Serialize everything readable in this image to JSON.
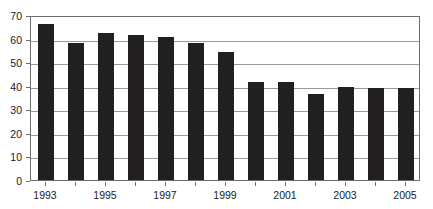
{
  "chart_data": {
    "type": "bar",
    "title": "",
    "subtitle": "",
    "xlabel": "",
    "ylabel": "",
    "categories": [
      "1993",
      "1994",
      "1995",
      "1996",
      "1997",
      "1998",
      "1999",
      "2000",
      "2001",
      "2002",
      "2003",
      "2004",
      "2005"
    ],
    "values": [
      66,
      58,
      62.5,
      61.5,
      60.5,
      58,
      54.5,
      41.5,
      41.5,
      36.5,
      39.5,
      39,
      39
    ],
    "series": [
      {
        "name": "",
        "values": [
          66,
          58,
          62.5,
          61.5,
          60.5,
          58,
          54.5,
          41.5,
          41.5,
          36.5,
          39.5,
          39,
          39
        ]
      }
    ],
    "ylim": [
      0,
      70
    ],
    "ytick_labels": [
      "0",
      "10",
      "20",
      "30",
      "40",
      "50",
      "60",
      "70"
    ],
    "ytick_values": [
      0,
      10,
      20,
      30,
      40,
      50,
      60,
      70
    ],
    "xtick_labels": [
      "1993",
      "1995",
      "1997",
      "1999",
      "2001",
      "2003",
      "2005"
    ],
    "xtick_categories": [
      "1993",
      "1995",
      "1997",
      "1999",
      "2001",
      "2003",
      "2005"
    ],
    "grid": true,
    "grid_axis": "y",
    "legend": false,
    "legend_position": "none",
    "bar_color": "#211f1f",
    "grid_color": "#9a9a9a",
    "axis_color": "#6e6e6e",
    "background_color": "#ffffff",
    "annotations": []
  }
}
